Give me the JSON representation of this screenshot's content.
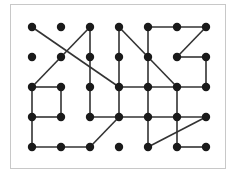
{
  "diagram": {
    "type": "grid-graph",
    "columns": 7,
    "rows": 5,
    "col_x": [
      32,
      61,
      90,
      119,
      148,
      177,
      206
    ],
    "row_y": [
      27,
      57,
      87,
      117,
      147
    ],
    "node_color": "#1a1a1a",
    "edge_color": "#333333",
    "node_radius": 4.2,
    "edge_width": 1.6,
    "nodes": [
      [
        0,
        0
      ],
      [
        1,
        0
      ],
      [
        2,
        0
      ],
      [
        3,
        0
      ],
      [
        4,
        0
      ],
      [
        5,
        0
      ],
      [
        6,
        0
      ],
      [
        0,
        1
      ],
      [
        1,
        1
      ],
      [
        2,
        1
      ],
      [
        3,
        1
      ],
      [
        4,
        1
      ],
      [
        5,
        1
      ],
      [
        6,
        1
      ],
      [
        0,
        2
      ],
      [
        1,
        2
      ],
      [
        2,
        2
      ],
      [
        3,
        2
      ],
      [
        4,
        2
      ],
      [
        5,
        2
      ],
      [
        6,
        2
      ],
      [
        0,
        3
      ],
      [
        1,
        3
      ],
      [
        2,
        3
      ],
      [
        3,
        3
      ],
      [
        4,
        3
      ],
      [
        5,
        3
      ],
      [
        6,
        3
      ],
      [
        0,
        4
      ],
      [
        1,
        4
      ],
      [
        2,
        4
      ],
      [
        3,
        4
      ],
      [
        4,
        4
      ],
      [
        5,
        4
      ],
      [
        6,
        4
      ]
    ],
    "edges": [
      [
        [
          0,
          0
        ],
        [
          3,
          2
        ]
      ],
      [
        [
          2,
          0
        ],
        [
          0,
          2
        ]
      ],
      [
        [
          2,
          0
        ],
        [
          2,
          3
        ]
      ],
      [
        [
          3,
          0
        ],
        [
          3,
          3
        ]
      ],
      [
        [
          3,
          0
        ],
        [
          5,
          2
        ]
      ],
      [
        [
          4,
          0
        ],
        [
          6,
          0
        ]
      ],
      [
        [
          6,
          0
        ],
        [
          5,
          1
        ]
      ],
      [
        [
          5,
          1
        ],
        [
          6,
          1
        ]
      ],
      [
        [
          6,
          1
        ],
        [
          6,
          2
        ]
      ],
      [
        [
          4,
          0
        ],
        [
          4,
          4
        ]
      ],
      [
        [
          3,
          2
        ],
        [
          6,
          2
        ]
      ],
      [
        [
          5,
          2
        ],
        [
          5,
          4
        ]
      ],
      [
        [
          0,
          2
        ],
        [
          1,
          2
        ]
      ],
      [
        [
          0,
          2
        ],
        [
          0,
          4
        ]
      ],
      [
        [
          1,
          2
        ],
        [
          1,
          3
        ]
      ],
      [
        [
          0,
          3
        ],
        [
          1,
          3
        ]
      ],
      [
        [
          2,
          3
        ],
        [
          6,
          3
        ]
      ],
      [
        [
          3,
          3
        ],
        [
          2,
          4
        ]
      ],
      [
        [
          0,
          4
        ],
        [
          2,
          4
        ]
      ],
      [
        [
          4,
          4
        ],
        [
          6,
          3
        ]
      ],
      [
        [
          5,
          4
        ],
        [
          6,
          4
        ]
      ]
    ]
  }
}
